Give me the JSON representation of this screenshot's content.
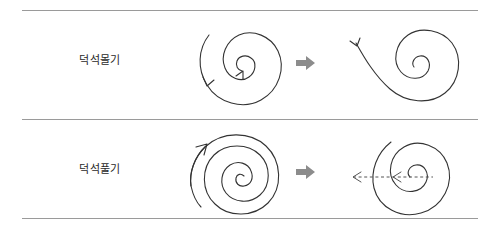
{
  "figure": {
    "background_color": "#ffffff",
    "rule_color": "#9a9a9a",
    "stroke_color": "#333333",
    "dashed_color": "#555555",
    "separator_arrow_color": "#8c8c8c"
  },
  "rows": [
    {
      "label": "덕석몰기",
      "left_figure": {
        "name": "single-turn-spiral-rolling-in",
        "spiral_turns": 1.6,
        "direction": "clockwise-inward",
        "arrowheads": [
          "outer-left-pointing-down",
          "inner-pointing-up-right"
        ]
      },
      "separator_arrow": {
        "name": "right-block-arrow",
        "direction": "right",
        "color": "#8c8c8c"
      },
      "right_figure": {
        "name": "spiral-with-extended-tail",
        "spiral_turns": 1.5,
        "direction": "clockwise-inward",
        "arrowheads": [
          "tail-end-pointing-down-left"
        ]
      }
    },
    {
      "label": "덕석풀기",
      "left_figure": {
        "name": "multi-turn-dense-spiral",
        "spiral_turns": 3.5,
        "direction": "counter-clockwise-outward",
        "arrowheads": [
          "outer-end-pointing-up-right"
        ]
      },
      "separator_arrow": {
        "name": "right-block-arrow",
        "direction": "right",
        "color": "#8c8c8c"
      },
      "right_figure": {
        "name": "spiral-with-dashed-unwind-arrows",
        "spiral_turns": 2.0,
        "direction": "clockwise-inward",
        "dashed_arrows": 2,
        "dashed_arrow_direction": "left"
      }
    }
  ]
}
